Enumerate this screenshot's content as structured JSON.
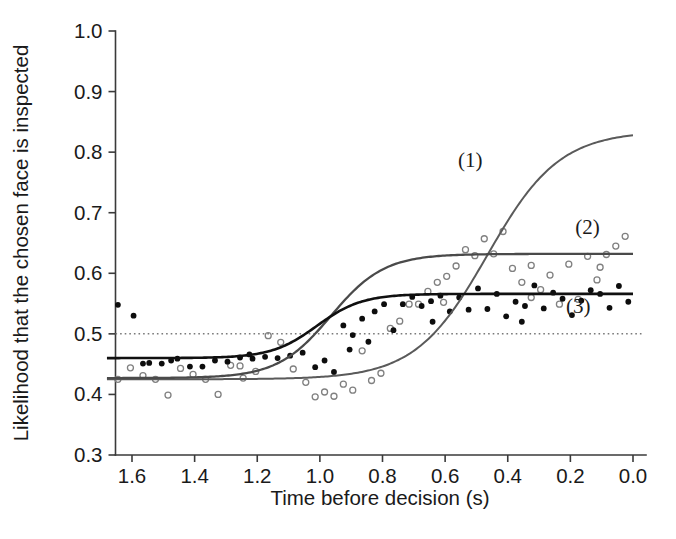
{
  "figure": {
    "background_color": "#ffffff",
    "width": 676,
    "height": 539
  },
  "chart_data": {
    "type": "line",
    "title": "",
    "subtitle": "",
    "xlabel": "Time before decision (s)",
    "ylabel": "Likelihood that the chosen face is inspected",
    "xlim": [
      1.68,
      0.0
    ],
    "ylim": [
      0.3,
      1.0
    ],
    "x_axis_reversed": true,
    "grid": false,
    "legend_position": "inline-annotations",
    "xticks": [
      1.6,
      1.4,
      1.2,
      1.0,
      0.8,
      0.6,
      0.4,
      0.2,
      0.0
    ],
    "xticklabels": [
      "1.6",
      "1.4",
      "1.2",
      "1.0",
      "0.8",
      "0.6",
      "0.4",
      "0.2",
      "0.0"
    ],
    "yticks": [
      0.3,
      0.4,
      0.5,
      0.6,
      0.7,
      0.8,
      0.9,
      1.0
    ],
    "yticklabels": [
      "0.3",
      "0.4",
      "0.5",
      "0.6",
      "0.7",
      "0.8",
      "0.9",
      "1.0"
    ],
    "reference_lines": [
      {
        "name": "chance-level",
        "orientation": "horizontal",
        "value": 0.5,
        "style": "dotted",
        "color": "#7a7a7a"
      }
    ],
    "annotations": [
      {
        "text": "(1)",
        "x": 0.52,
        "y": 0.775,
        "series": "curve-1"
      },
      {
        "text": "(2)",
        "x": 0.145,
        "y": 0.665,
        "series": "curve-2"
      },
      {
        "text": "(3)",
        "x": 0.175,
        "y": 0.535,
        "series": "curve-3"
      }
    ],
    "series": [
      {
        "name": "(1)",
        "label": "(1)",
        "kind": "fitted-sigmoid",
        "color": "#5a5a5a",
        "linewidth": 2.0,
        "has_points": false,
        "fit": {
          "model": "logistic",
          "asymptote_low": 0.425,
          "asymptote_high": 0.835,
          "midpoint_x": 0.465,
          "slope_scale": 0.115
        },
        "x": [
          1.68,
          1.6,
          1.5,
          1.4,
          1.3,
          1.2,
          1.1,
          1.0,
          0.9,
          0.8,
          0.7,
          0.6,
          0.55,
          0.5,
          0.45,
          0.4,
          0.35,
          0.3,
          0.25,
          0.2,
          0.15,
          0.1,
          0.05,
          0.0
        ],
        "y": [
          0.425,
          0.425,
          0.426,
          0.427,
          0.428,
          0.43,
          0.434,
          0.441,
          0.454,
          0.477,
          0.516,
          0.575,
          0.609,
          0.644,
          0.678,
          0.71,
          0.738,
          0.762,
          0.782,
          0.798,
          0.81,
          0.82,
          0.827,
          0.833
        ]
      },
      {
        "name": "(2)",
        "label": "(2)",
        "kind": "fitted-sigmoid",
        "color": "#4a4a4a",
        "linewidth": 2.3,
        "has_points": true,
        "point_style": "open-circle",
        "point_color": "#808080",
        "fit": {
          "model": "logistic",
          "asymptote_low": 0.427,
          "asymptote_high": 0.632,
          "midpoint_x": 0.965,
          "slope_scale": 0.085
        },
        "x": [
          1.68,
          1.6,
          1.5,
          1.4,
          1.3,
          1.25,
          1.2,
          1.15,
          1.1,
          1.05,
          1.0,
          0.95,
          0.9,
          0.85,
          0.8,
          0.75,
          0.7,
          0.6,
          0.5,
          0.4,
          0.3,
          0.2,
          0.1,
          0.0
        ],
        "y": [
          0.427,
          0.427,
          0.428,
          0.43,
          0.435,
          0.44,
          0.447,
          0.459,
          0.477,
          0.501,
          0.53,
          0.559,
          0.584,
          0.603,
          0.615,
          0.623,
          0.627,
          0.631,
          0.632,
          0.632,
          0.632,
          0.632,
          0.632,
          0.632
        ]
      },
      {
        "name": "(3)",
        "label": "(3)",
        "kind": "fitted-sigmoid",
        "color": "#101010",
        "linewidth": 2.6,
        "has_points": true,
        "point_style": "filled-dot",
        "point_color": "#0d0d0d",
        "fit": {
          "model": "logistic",
          "asymptote_low": 0.46,
          "asymptote_high": 0.566,
          "midpoint_x": 1.01,
          "slope_scale": 0.072
        },
        "x": [
          1.68,
          1.6,
          1.5,
          1.4,
          1.3,
          1.25,
          1.2,
          1.15,
          1.1,
          1.05,
          1.0,
          0.95,
          0.9,
          0.85,
          0.8,
          0.75,
          0.7,
          0.6,
          0.5,
          0.4,
          0.3,
          0.2,
          0.1,
          0.0
        ],
        "y": [
          0.46,
          0.46,
          0.46,
          0.461,
          0.463,
          0.465,
          0.468,
          0.474,
          0.483,
          0.496,
          0.513,
          0.53,
          0.544,
          0.554,
          0.56,
          0.563,
          0.565,
          0.566,
          0.566,
          0.566,
          0.566,
          0.566,
          0.566,
          0.566
        ]
      }
    ],
    "scatter_filled": {
      "name": "filled-dots",
      "marker": "filled circle",
      "color": "#0d0d0d",
      "points": [
        [
          1.645,
          0.548
        ],
        [
          1.595,
          0.53
        ],
        [
          1.545,
          0.452
        ],
        [
          1.505,
          0.451
        ],
        [
          1.455,
          0.459
        ],
        [
          1.415,
          0.446
        ],
        [
          1.375,
          0.446
        ],
        [
          1.335,
          0.456
        ],
        [
          1.295,
          0.454
        ],
        [
          1.255,
          0.461
        ],
        [
          1.215,
          0.459
        ],
        [
          1.175,
          0.462
        ],
        [
          1.135,
          0.46
        ],
        [
          1.095,
          0.464
        ],
        [
          1.055,
          0.469
        ],
        [
          1.015,
          0.445
        ],
        [
          0.985,
          0.456
        ],
        [
          0.955,
          0.437
        ],
        [
          0.925,
          0.514
        ],
        [
          0.895,
          0.498
        ],
        [
          0.865,
          0.525
        ],
        [
          0.845,
          0.487
        ],
        [
          0.825,
          0.537
        ],
        [
          0.795,
          0.549
        ],
        [
          0.765,
          0.506
        ],
        [
          0.735,
          0.549
        ],
        [
          0.705,
          0.561
        ],
        [
          0.675,
          0.546
        ],
        [
          0.645,
          0.554
        ],
        [
          0.615,
          0.563
        ],
        [
          0.585,
          0.537
        ],
        [
          0.555,
          0.56
        ],
        [
          0.525,
          0.54
        ],
        [
          0.495,
          0.575
        ],
        [
          0.465,
          0.541
        ],
        [
          0.435,
          0.566
        ],
        [
          0.405,
          0.529
        ],
        [
          0.375,
          0.553
        ],
        [
          0.345,
          0.546
        ],
        [
          0.315,
          0.58
        ],
        [
          0.285,
          0.542
        ],
        [
          0.255,
          0.568
        ],
        [
          0.225,
          0.558
        ],
        [
          0.195,
          0.531
        ],
        [
          0.165,
          0.555
        ],
        [
          0.135,
          0.572
        ],
        [
          0.105,
          0.566
        ],
        [
          0.075,
          0.543
        ],
        [
          0.045,
          0.579
        ],
        [
          0.015,
          0.553
        ],
        [
          1.565,
          0.451
        ],
        [
          1.475,
          0.456
        ],
        [
          1.225,
          0.466
        ],
        [
          0.905,
          0.474
        ],
        [
          0.64,
          0.52
        ],
        [
          0.355,
          0.52
        ]
      ]
    },
    "scatter_open": {
      "name": "open-circles",
      "marker": "open circle",
      "color": "#808080",
      "points": [
        [
          1.645,
          0.425
        ],
        [
          1.605,
          0.444
        ],
        [
          1.565,
          0.431
        ],
        [
          1.525,
          0.425
        ],
        [
          1.485,
          0.399
        ],
        [
          1.445,
          0.443
        ],
        [
          1.405,
          0.433
        ],
        [
          1.365,
          0.425
        ],
        [
          1.325,
          0.4
        ],
        [
          1.285,
          0.448
        ],
        [
          1.245,
          0.427
        ],
        [
          1.205,
          0.438
        ],
        [
          1.165,
          0.497
        ],
        [
          1.125,
          0.486
        ],
        [
          1.085,
          0.442
        ],
        [
          1.045,
          0.42
        ],
        [
          1.015,
          0.396
        ],
        [
          0.985,
          0.404
        ],
        [
          0.955,
          0.397
        ],
        [
          0.925,
          0.417
        ],
        [
          0.895,
          0.407
        ],
        [
          0.865,
          0.472
        ],
        [
          0.835,
          0.423
        ],
        [
          0.805,
          0.435
        ],
        [
          0.775,
          0.509
        ],
        [
          0.745,
          0.521
        ],
        [
          0.715,
          0.549
        ],
        [
          0.685,
          0.549
        ],
        [
          0.655,
          0.57
        ],
        [
          0.625,
          0.585
        ],
        [
          0.595,
          0.595
        ],
        [
          0.565,
          0.612
        ],
        [
          0.535,
          0.639
        ],
        [
          0.505,
          0.629
        ],
        [
          0.475,
          0.657
        ],
        [
          0.445,
          0.632
        ],
        [
          0.415,
          0.669
        ],
        [
          0.385,
          0.608
        ],
        [
          0.355,
          0.585
        ],
        [
          0.325,
          0.613
        ],
        [
          0.295,
          0.573
        ],
        [
          0.265,
          0.597
        ],
        [
          0.235,
          0.549
        ],
        [
          0.205,
          0.615
        ],
        [
          0.175,
          0.557
        ],
        [
          0.145,
          0.628
        ],
        [
          0.115,
          0.589
        ],
        [
          0.085,
          0.631
        ],
        [
          0.055,
          0.645
        ],
        [
          0.025,
          0.661
        ],
        [
          1.255,
          0.447
        ],
        [
          0.605,
          0.552
        ],
        [
          0.325,
          0.56
        ],
        [
          0.105,
          0.61
        ]
      ]
    }
  }
}
